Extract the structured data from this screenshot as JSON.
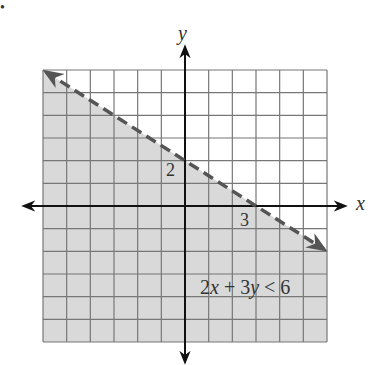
{
  "bullet": "•",
  "chart_data": {
    "type": "line",
    "title": "",
    "inequality": "2x + 3y < 6",
    "boundary_line": {
      "equation": "2x + 3y = 6",
      "style": "dashed",
      "slope": -0.6667,
      "y_intercept": 2,
      "x_intercept": 3,
      "points": [
        [
          -6,
          6
        ],
        [
          6,
          -2
        ]
      ]
    },
    "shaded_region": "below the line",
    "xlabel": "x",
    "ylabel": "y",
    "xlim": [
      -6,
      6
    ],
    "ylim": [
      -6,
      6
    ],
    "grid": true,
    "annotations": [
      {
        "text": "2",
        "at": [
          0,
          2
        ]
      },
      {
        "text": "3",
        "at": [
          3,
          0
        ]
      }
    ],
    "colors": {
      "shade": "#d9d9d9",
      "grid": "#777777",
      "line": "#555555",
      "axis": "#111111"
    }
  },
  "labels": {
    "x_axis": "x",
    "y_axis": "y",
    "y_intercept": "2",
    "x_intercept": "3",
    "inequality": "2x + 3y < 6"
  }
}
